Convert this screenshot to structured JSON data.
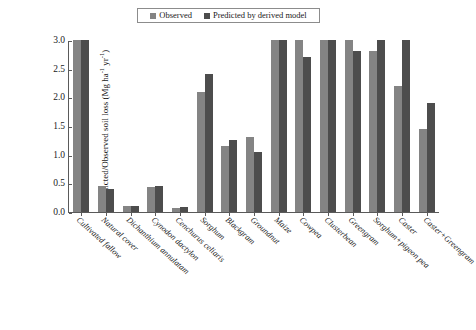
{
  "chart_data": {
    "type": "bar",
    "title": "",
    "subtitle": "",
    "xlabel": "",
    "ylabel": "Predicted/Observed soil loss (Mg ha-1 yr-1)",
    "ylabel_parts": {
      "prefix": "Predicted/Observed soil loss (Mg ha",
      "sup1": "-1",
      "mid": " yr",
      "sup2": "-1",
      "suffix": ")"
    },
    "ylim": [
      0.0,
      3.0
    ],
    "yticks": [
      "0.0",
      "0.5",
      "1.0",
      "1.5",
      "2.0",
      "2.5",
      "3.0"
    ],
    "ytick_values": [
      0.0,
      0.5,
      1.0,
      1.5,
      2.0,
      2.5,
      3.0
    ],
    "grid": false,
    "legend_position": "top-center",
    "categories": [
      "Cultivated fallow",
      "Natural cover",
      "Dichanthium annulatam",
      "Cynodon dactylon",
      "Cenchurus celiaris",
      "Sorghum",
      "Blackgram",
      "Groundnut",
      "Maize",
      "Cowpea",
      "Clusterbean",
      "Greengram",
      "Sorghum+pigeon pea",
      "Caster",
      "Caster+Greengram"
    ],
    "series": [
      {
        "name": "Observed",
        "color": "#848484",
        "values": [
          3.0,
          0.45,
          0.1,
          0.43,
          0.07,
          2.1,
          1.15,
          1.3,
          3.0,
          3.0,
          3.0,
          3.0,
          2.8,
          2.2,
          1.45
        ]
      },
      {
        "name": "Predicted by derived model",
        "color": "#4d4d4d",
        "values": [
          3.0,
          0.4,
          0.1,
          0.45,
          0.08,
          2.4,
          1.25,
          1.05,
          3.0,
          2.7,
          3.0,
          2.8,
          3.0,
          3.0,
          1.9
        ]
      }
    ]
  },
  "legend": {
    "items": [
      {
        "label": "Observed",
        "color": "#848484"
      },
      {
        "label": "Predicted by derived model",
        "color": "#4d4d4d"
      }
    ]
  }
}
